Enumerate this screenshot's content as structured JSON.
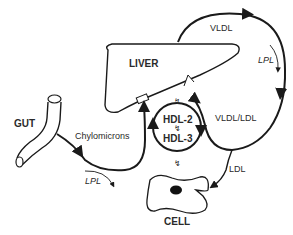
{
  "diagram": {
    "type": "lipoprotein-metabolism",
    "nodes": {
      "liver": "LIVER",
      "gut": "GUT",
      "cell": "CELL",
      "hdl2": "HDL-2",
      "hdl3": "HDL-3"
    },
    "edges": {
      "chylomicrons": "Chylomicrons",
      "vldl": "VLDL",
      "vldl_ldl": "VLDL/LDL",
      "ldl": "LDL",
      "lpl_top": "LPL",
      "lpl_bottom": "LPL"
    },
    "colors": {
      "stroke": "#1a1a1a",
      "text": "#2a2a2a",
      "background": "#ffffff"
    }
  }
}
